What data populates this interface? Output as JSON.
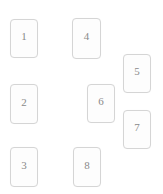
{
  "board": {
    "background": "#ffffff"
  },
  "cards": [
    {
      "label": "1"
    },
    {
      "label": "2"
    },
    {
      "label": "3"
    },
    {
      "label": "4"
    },
    {
      "label": "5"
    },
    {
      "label": "6"
    },
    {
      "label": "7"
    },
    {
      "label": "8"
    }
  ],
  "style": {
    "card_background": "#fdfdfd",
    "card_border_color": "#d5d5d5",
    "number_color": "#8a8a8a"
  }
}
